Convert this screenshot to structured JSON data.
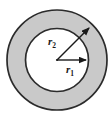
{
  "figure": {
    "background_color": "#ffffff",
    "annulus_fill": "#c9c9c9",
    "inner_fill": "#ffffff",
    "stroke_color": "#2b2b2b",
    "outer_circle": {
      "center_x": 57,
      "center_y": 60,
      "radius": 50
    },
    "inner_circle": {
      "center_x": 57,
      "center_y": 60,
      "radius": 31.5
    },
    "labels": {
      "outer_radius": {
        "base": "r",
        "subscript": "2",
        "x": 49,
        "y": 45
      },
      "inner_radius": {
        "base": "r",
        "subscript": "1",
        "x": 67,
        "y": 73
      }
    },
    "arrows": [
      {
        "name": "inner-radius-arrow",
        "from_x": 57,
        "from_y": 60,
        "to_x": 88,
        "to_y": 60
      },
      {
        "name": "outer-radius-arrow",
        "from_x": 57,
        "from_y": 60,
        "to_x": 92,
        "to_y": 25
      }
    ]
  }
}
